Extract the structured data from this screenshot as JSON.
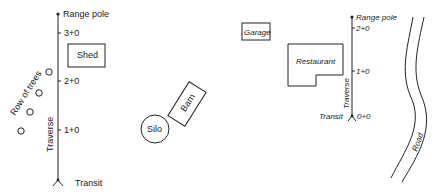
{
  "left_diagram": {
    "range_pole_label": "Range pole",
    "transit_label": "Transit",
    "traverse_label": "Traverse",
    "stations": [
      {
        "label": "3+0",
        "y": 33
      },
      {
        "label": "2+0",
        "y": 81
      },
      {
        "label": "1+0",
        "y": 130
      }
    ],
    "shed_label": "Shed",
    "barn_label": "Barn",
    "silo_label": "Silo",
    "trees_label": "Row of trees"
  },
  "right_diagram": {
    "range_pole_label": "Range pole",
    "transit_label": "Transit",
    "traverse_label": "Traverse",
    "stations": [
      {
        "label": "2+0",
        "y": 28
      },
      {
        "label": "1+0",
        "y": 71
      },
      {
        "label": "0+0",
        "y": 116
      }
    ],
    "garage_label": "Garage",
    "restaurant_label": "Restaurant",
    "road_label": "Road"
  },
  "colors": {
    "ink": "#222222",
    "background": "#ffffff"
  }
}
